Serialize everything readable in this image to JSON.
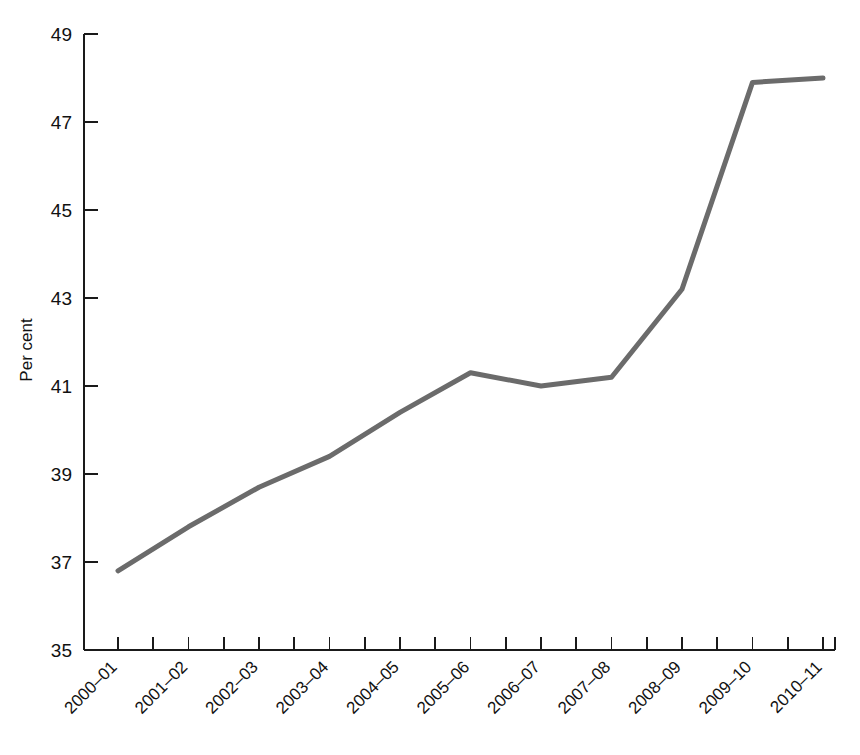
{
  "chart_data": {
    "type": "line",
    "title": "",
    "subtitle": "",
    "xlabel": "",
    "ylabel": "Per cent",
    "categories": [
      "2000–01",
      "2001–02",
      "2002–03",
      "2003–04",
      "2004–05",
      "2005–06",
      "2006–07",
      "2007–08",
      "2008–09",
      "2009–10",
      "2010–11"
    ],
    "values": [
      36.8,
      37.8,
      38.7,
      39.4,
      40.4,
      41.3,
      41.0,
      41.2,
      43.2,
      47.9,
      48.0
    ],
    "series": [
      {
        "name": "Per cent",
        "values": [
          36.8,
          37.8,
          38.7,
          39.4,
          40.4,
          41.3,
          41.0,
          41.2,
          43.2,
          47.9,
          48.0
        ],
        "color": "#6b6b6b"
      }
    ],
    "ylim": [
      35,
      49
    ],
    "ytick_step": 2,
    "ytick_labels": [
      "35",
      "37",
      "39",
      "41",
      "43",
      "45",
      "47",
      "49"
    ],
    "grid": false,
    "legend": false,
    "legend_position": "none",
    "x_tick_rotation_deg": 45,
    "minor_ticks_x": true,
    "line_color": "#6b6b6b",
    "axis_color": "#1a1a1a",
    "background_color": "#ffffff"
  }
}
